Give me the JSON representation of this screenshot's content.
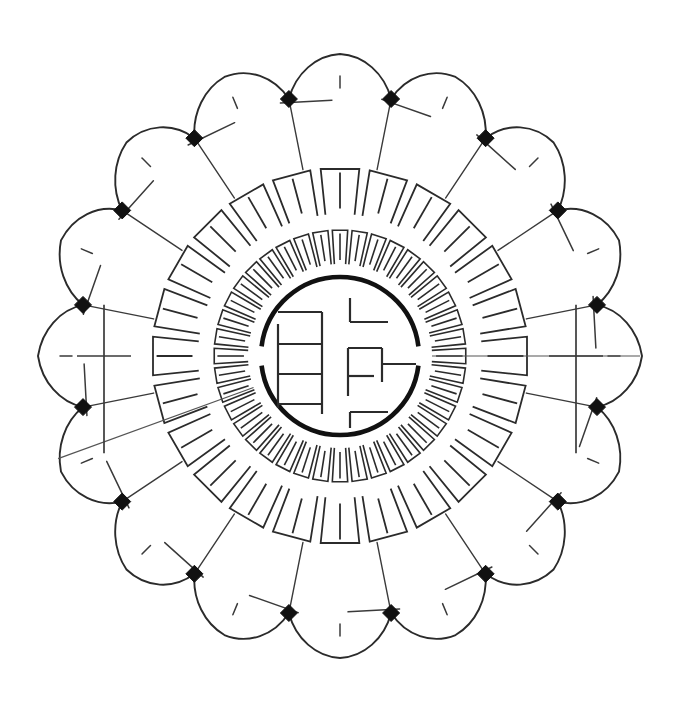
{
  "drawing": {
    "title": "Radial Lotus Auditorium Plan",
    "kind": "architectural-plan",
    "background_color": "#ffffff",
    "ink_color": "#2b2b2b",
    "node_color": "#111111",
    "canvas": {
      "width": 680,
      "height": 708
    },
    "center": {
      "x": 340,
      "y": 356
    }
  },
  "chart_data": {
    "type": "scatter",
    "xlabel": "",
    "ylabel": "",
    "grid": false,
    "legend_position": "none",
    "polar": true,
    "center_x": 340,
    "center_y": 356,
    "rings": [
      {
        "name": "petal-ring",
        "count": 16,
        "node_radius": 262,
        "petal_tip_radius": 302,
        "petal_arc_radius": 56,
        "node_marker": "filled-diamond",
        "node_size": 17
      },
      {
        "name": "outer-seat-ring",
        "count": 24,
        "inner_radius": 142,
        "outer_radius": 188,
        "block_gap_degrees": 3.2
      },
      {
        "name": "inner-seat-ring",
        "count": 40,
        "inner_radius": 92,
        "outer_radius": 126,
        "block_gap_degrees": 2.0
      },
      {
        "name": "core-ring",
        "count": 1,
        "radius": 79,
        "gap_degrees": 14,
        "gap_angles": [
          90,
          270
        ]
      }
    ],
    "petal_spine_count": 16,
    "petal_diagonal_count": 16,
    "radial_strut_count": 16,
    "node_count": 16,
    "cross_marks": [
      {
        "angle_degrees": 90,
        "radius": 236,
        "arm_length": 27
      },
      {
        "angle_degrees": 270,
        "radius": 236,
        "arm_length": 27
      }
    ],
    "axis_lines": [
      {
        "angle_degrees": 90,
        "from_radius": 92,
        "to_radius": 300
      },
      {
        "angle_degrees": 250,
        "from_radius": 92,
        "to_radius": 300
      }
    ],
    "core_glyph": {
      "name": "seal-character",
      "description": "stylised character composed of orthogonal bars inside a broken circle",
      "bar_count": 14
    }
  },
  "labels": {
    "petal_ring": "petal-ring",
    "outer_seat_ring": "outer-seat-ring",
    "inner_seat_ring": "inner-seat-ring",
    "core_ring": "core-ring",
    "core_glyph": "core-glyph"
  }
}
